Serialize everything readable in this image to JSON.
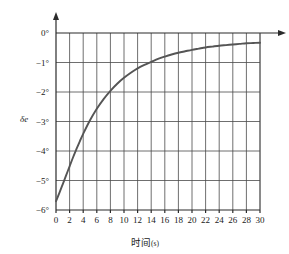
{
  "chart_data": {
    "type": "line",
    "title": "",
    "subtitle": "",
    "xlabel_cn": "时间",
    "xlabel_unit": "(s)",
    "ylabel": "δe",
    "xlim": [
      0,
      30
    ],
    "ylim": [
      -6,
      0
    ],
    "grid": true,
    "legend": false,
    "x_ticks": [
      0,
      2,
      4,
      6,
      8,
      10,
      12,
      14,
      16,
      18,
      20,
      22,
      24,
      26,
      28,
      30
    ],
    "x_tick_labels": [
      "0",
      "2",
      "4",
      "6",
      "8",
      "10",
      "12",
      "14",
      "16",
      "18",
      "20",
      "22",
      "24",
      "26",
      "28",
      "30"
    ],
    "y_ticks": [
      0,
      -1,
      -2,
      -3,
      -4,
      -5,
      -6
    ],
    "y_tick_labels": [
      "0°",
      "−1°",
      "−2°",
      "−3°",
      "−4°",
      "−5°",
      "−6°"
    ],
    "series": [
      {
        "name": "elevator deflection",
        "color": "#555555",
        "x": [
          0,
          0.5,
          1,
          1.5,
          2,
          2.5,
          3,
          3.5,
          4,
          5,
          6,
          7,
          8,
          9,
          10,
          11,
          12,
          13,
          14,
          15,
          16,
          17,
          18,
          19,
          20,
          21,
          22,
          23,
          24,
          25,
          26,
          27,
          28,
          29,
          30
        ],
        "y": [
          -5.7,
          -5.42,
          -5.12,
          -4.82,
          -4.52,
          -4.22,
          -3.94,
          -3.67,
          -3.42,
          -2.96,
          -2.57,
          -2.24,
          -1.96,
          -1.72,
          -1.52,
          -1.35,
          -1.2,
          -1.08,
          -0.98,
          -0.88,
          -0.8,
          -0.73,
          -0.67,
          -0.62,
          -0.57,
          -0.53,
          -0.49,
          -0.46,
          -0.43,
          -0.41,
          -0.39,
          -0.37,
          -0.35,
          -0.34,
          -0.33
        ]
      }
    ],
    "annotations": {
      "start_value": -5.7,
      "asymptote": -0.33,
      "cross_minus4_at": 2.8,
      "cross_minus2_at": 8.0,
      "cross_minus1_at": 14.0
    },
    "axis_arrows": {
      "x_axis_arrow": "right",
      "y_axis_arrow": "up"
    }
  },
  "colors": {
    "curve": "#555555",
    "grid": "#4a4a4a",
    "axis": "#2b2b2b",
    "background": "#ffffff",
    "text": "#1a1a1a"
  }
}
